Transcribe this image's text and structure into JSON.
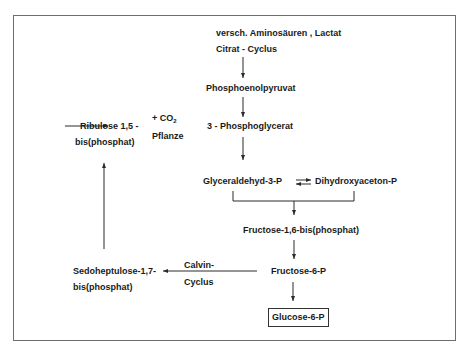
{
  "diagram": {
    "nodes": {
      "sources_line1": "versch. Aminosäuren , Lactat",
      "sources_line2": "Citrat - Cyclus",
      "phosphoenolpyruvat": "Phosphoenolpyruvat",
      "phosphoglycerat": "3 - Phosphoglycerat",
      "ribulose_line1": "Ribulose 1,5 -",
      "ribulose_line2": "bis(phosphat)",
      "glyceraldehyd": "Glyceraldehyd-3-P",
      "dihydroxyaceton": "Dihydroxyaceton-P",
      "fructose_bis": "Fructose-1,6-bis(phosphat)",
      "fructose_6p": "Fructose-6-P",
      "glucose_6p": "Glucose-6-P",
      "sedoheptulose_line1": "Sedoheptulose-1,7-",
      "sedoheptulose_line2": "bis(phosphat)"
    },
    "edge_labels": {
      "co2_prefix": "+ CO",
      "co2_sub": "2",
      "pflanze": "Pflanze",
      "calvin_line1": "Calvin-",
      "calvin_line2": "Cyclus"
    },
    "colors": {
      "line": "#2a2a2a",
      "frame": "#6e6e6e"
    }
  }
}
